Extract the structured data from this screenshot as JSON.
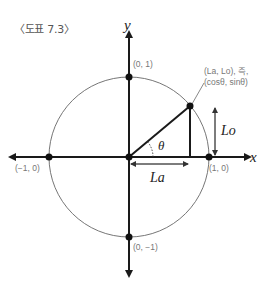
{
  "figure": {
    "caption": "〈도표 7.3〉"
  },
  "axes": {
    "x_label": "x",
    "y_label": "y"
  },
  "points": {
    "top": "(0, 1)",
    "bottom": "(0, −1)",
    "left": "(−1, 0)",
    "right": "(1, 0)"
  },
  "annotation": {
    "line1": "(La, Lo), 즉,",
    "line2": "(cosθ, sinθ)"
  },
  "labels": {
    "angle": "θ",
    "la": "La",
    "lo": "Lo"
  },
  "colors": {
    "axis": "#1a1a1a",
    "circle": "#666666",
    "label": "#777777"
  }
}
